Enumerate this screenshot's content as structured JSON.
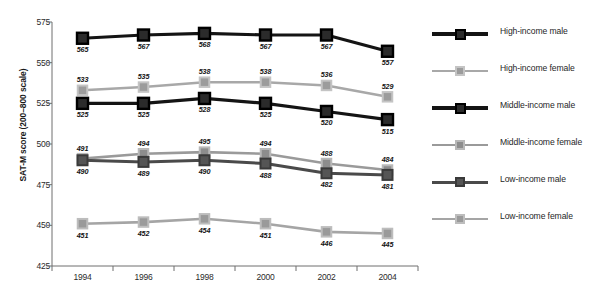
{
  "chart_data": {
    "type": "line",
    "title": "",
    "xlabel": "",
    "ylabel": "SAT-M score (200–800 scale)",
    "categories": [
      "1994",
      "1996",
      "1998",
      "2000",
      "2002",
      "2004"
    ],
    "ylim": [
      425,
      575
    ],
    "yticks": [
      425,
      450,
      475,
      500,
      525,
      550,
      575
    ],
    "grid": false,
    "legend_position": "right",
    "series": [
      {
        "name": "High-income male",
        "color": "#141414",
        "marker_fill": "#2b2b2b",
        "marker_border": "#000000",
        "values": [
          565,
          567,
          568,
          567,
          567,
          557
        ],
        "label_pos": [
          "below",
          "below",
          "below",
          "below",
          "below",
          "below"
        ]
      },
      {
        "name": "High-income female",
        "color": "#a8a8a8",
        "marker_fill": "#9c9c9c",
        "marker_border": "#c4c4c4",
        "values": [
          533,
          535,
          538,
          538,
          536,
          529
        ],
        "label_pos": [
          "above",
          "above",
          "above",
          "above",
          "above",
          "above"
        ]
      },
      {
        "name": "Middle-income male",
        "color": "#141414",
        "marker_fill": "#2b2b2b",
        "marker_border": "#000000",
        "values": [
          525,
          525,
          528,
          525,
          520,
          515
        ],
        "label_pos": [
          "below",
          "below",
          "below",
          "below",
          "below",
          "below"
        ]
      },
      {
        "name": "Middle-income female",
        "color": "#9a9a9a",
        "marker_fill": "#8d8d8d",
        "marker_border": "#b8b8b8",
        "values": [
          491,
          494,
          495,
          494,
          488,
          484
        ],
        "label_pos": [
          "above",
          "above",
          "above",
          "above",
          "above",
          "above"
        ]
      },
      {
        "name": "Low-income male",
        "color": "#4a4a4a",
        "marker_fill": "#555555",
        "marker_border": "#3a3a3a",
        "values": [
          490,
          489,
          490,
          488,
          482,
          481
        ],
        "label_pos": [
          "below",
          "below",
          "below",
          "below",
          "below",
          "below"
        ]
      },
      {
        "name": "Low-income female",
        "color": "#a5a5a5",
        "marker_fill": "#9a9a9a",
        "marker_border": "#bdbdbd",
        "values": [
          451,
          452,
          454,
          451,
          446,
          445
        ],
        "label_pos": [
          "below",
          "below",
          "below",
          "below",
          "below",
          "below"
        ]
      }
    ]
  },
  "axis": {
    "y_title": "SAT-M score (200–800 scale)"
  }
}
